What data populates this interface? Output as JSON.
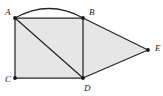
{
  "figure": {
    "background_color": "#ffffff",
    "fill_color": "#e6e6e6",
    "stroke_color": "#262626",
    "label_color": "#1a1a1a",
    "vertices": [
      {
        "name": "A",
        "label": "A",
        "x": 15,
        "y": 18,
        "label_x": 5,
        "label_y": 13
      },
      {
        "name": "B",
        "label": "B",
        "x": 83,
        "y": 18,
        "label_x": 89,
        "label_y": 13
      },
      {
        "name": "C",
        "label": "C",
        "x": 15,
        "y": 78,
        "label_x": 5,
        "label_y": 80
      },
      {
        "name": "D",
        "label": "D",
        "x": 83,
        "y": 78,
        "label_x": 84,
        "label_y": 89
      },
      {
        "name": "E",
        "label": "E",
        "x": 148,
        "y": 50,
        "label_x": 155,
        "label_y": 49
      }
    ],
    "regions": [
      {
        "name": "square-acdb",
        "points": "15,18 83,18 83,78 15,78"
      },
      {
        "name": "triangle-bde",
        "points": "83,18 148,50 83,78"
      }
    ],
    "edges": [
      {
        "name": "edge-ab",
        "from": "A",
        "to": "B",
        "x1": 15,
        "y1": 18,
        "x2": 83,
        "y2": 18
      },
      {
        "name": "edge-ac",
        "from": "A",
        "to": "C",
        "x1": 15,
        "y1": 18,
        "x2": 15,
        "y2": 78
      },
      {
        "name": "edge-cd",
        "from": "C",
        "to": "D",
        "x1": 15,
        "y1": 78,
        "x2": 83,
        "y2": 78
      },
      {
        "name": "edge-bd",
        "from": "B",
        "to": "D",
        "x1": 83,
        "y1": 18,
        "x2": 83,
        "y2": 78
      },
      {
        "name": "edge-ad-diagonal",
        "from": "A",
        "to": "D",
        "x1": 15,
        "y1": 18,
        "x2": 83,
        "y2": 78
      },
      {
        "name": "edge-be",
        "from": "B",
        "to": "E",
        "x1": 83,
        "y1": 18,
        "x2": 148,
        "y2": 50
      },
      {
        "name": "edge-de",
        "from": "D",
        "to": "E",
        "x1": 83,
        "y1": 78,
        "x2": 148,
        "y2": 50
      }
    ],
    "arc": {
      "name": "arc-ab",
      "from": "A",
      "to": "B",
      "path": "M 15 18 Q 49 -1 83 18",
      "apex_y": 5,
      "bulge": "upward"
    }
  }
}
